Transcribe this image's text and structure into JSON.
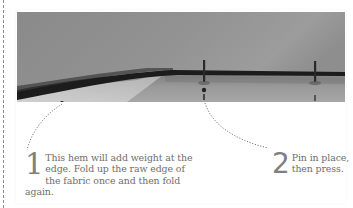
{
  "photo": {
    "subject": "folded fabric hem with pins",
    "colors": {
      "fabric": "#8f8f8f",
      "fold_shadow": "#1e1e1e",
      "hem_lower": "#a4a4a4",
      "raw_edge": "#c8c8c8"
    }
  },
  "steps": [
    {
      "number": "1",
      "text": "This hem will add weight at the edge. Fold up the raw edge of the fabric once and then fold again."
    },
    {
      "number": "2",
      "text": "Pin in place, then press."
    }
  ],
  "colors": {
    "text": "#6e6e6e",
    "number": "#808080",
    "leader": "#7a7a7a",
    "border": "#8a8a8a"
  }
}
